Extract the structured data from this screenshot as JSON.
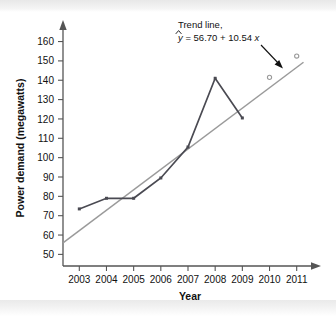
{
  "chart_data": {
    "type": "line",
    "title": "",
    "xlabel": "Year",
    "ylabel": "Power demand (megawatts)",
    "x": [
      2003,
      2004,
      2005,
      2006,
      2007,
      2008,
      2009,
      2010,
      2011
    ],
    "xlim": [
      2002.4,
      2011.6
    ],
    "ylim": [
      44,
      167
    ],
    "yticks": [
      50,
      60,
      70,
      80,
      90,
      100,
      110,
      120,
      130,
      140,
      150,
      160
    ],
    "xtick_labels": [
      "2003",
      "2004",
      "2005",
      "2006",
      "2007",
      "2008",
      "2009",
      "2010",
      "2011"
    ],
    "grid": false,
    "legend_position": "none",
    "series": [
      {
        "name": "Power demand",
        "type": "line",
        "color": "#4a4a52",
        "marker": "filled-square",
        "x": [
          2003,
          2004,
          2005,
          2006,
          2007,
          2008,
          2009
        ],
        "values": [
          73.5,
          79.0,
          79.0,
          89.5,
          105.5,
          141.0,
          120.5
        ]
      },
      {
        "name": "Trend line",
        "type": "line",
        "color": "#9a9a9a",
        "marker": "open-circle",
        "marker_x": [
          2010,
          2011
        ],
        "marker_values": [
          141.5,
          152.5
        ],
        "x": [
          2002.4,
          2011.25
        ],
        "values": [
          56.0,
          149.3
        ],
        "equation_intercept": 56.7,
        "equation_slope": 10.54
      }
    ],
    "annotations": [
      {
        "name": "trend-line-callout",
        "line1": "Trend line,",
        "line2_prefix": "y",
        "line2_rest": " = 56.70 + 10.54",
        "line2_var": "x",
        "full_text": "Trend line, ŷ = 56.70 + 10.54x",
        "arrow": "points down-right toward trend line"
      }
    ],
    "axis_style": {
      "y_axis_arrow": true,
      "x_axis_arrow": true,
      "axis_color": "#555555"
    }
  }
}
